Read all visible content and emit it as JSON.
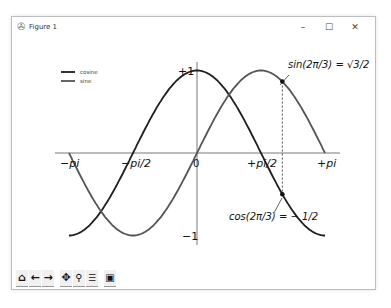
{
  "window": {
    "title": "Figure 1",
    "controls": {
      "minimize": "–",
      "maximize": "☐",
      "close": "✕"
    }
  },
  "toolbar": {
    "buttons": [
      {
        "name": "home",
        "glyph": "⌂"
      },
      {
        "name": "back",
        "glyph": "←"
      },
      {
        "name": "forward",
        "glyph": "→"
      },
      {
        "name": "pan",
        "glyph": "✥"
      },
      {
        "name": "zoom",
        "glyph": "🔍"
      },
      {
        "name": "configure-subplots",
        "glyph": "☰"
      },
      {
        "name": "save",
        "glyph": "💾"
      }
    ]
  },
  "chart_data": {
    "type": "line",
    "title": "",
    "xlabel": "",
    "ylabel": "",
    "xlim": [
      -3.1416,
      3.1416
    ],
    "ylim": [
      -1.1,
      1.1
    ],
    "grid": false,
    "legend": {
      "position": "upper left",
      "entries": [
        "cosine",
        "sine"
      ]
    },
    "x_ticks": [
      {
        "value": -3.1416,
        "label": "−pi"
      },
      {
        "value": -1.5708,
        "label": "−pi/2"
      },
      {
        "value": 0,
        "label": "0"
      },
      {
        "value": 1.5708,
        "label": "+pi/2"
      },
      {
        "value": 3.1416,
        "label": "+pi"
      }
    ],
    "y_ticks": [
      {
        "value": -1,
        "label": "−1"
      },
      {
        "value": 1,
        "label": "+1"
      }
    ],
    "series": [
      {
        "name": "cosine",
        "function": "cos(x)",
        "color": "#1f1f1f"
      },
      {
        "name": "sine",
        "function": "sin(x)",
        "color": "#555555"
      }
    ],
    "annotations": [
      {
        "text": "sin(2π/3) = √3/2",
        "x": 2.0944,
        "y": 0.866
      },
      {
        "text": "cos(2π/3) = −1/2",
        "x": 2.0944,
        "y": -0.5
      }
    ],
    "vline": {
      "x": 2.0944,
      "style": "dashed",
      "from": -0.5,
      "to": 0.866
    }
  },
  "labels": {
    "sin_ann": "sin(2π/3) = √3/2",
    "cos_ann": "cos(2π/3) = − 1/2"
  }
}
